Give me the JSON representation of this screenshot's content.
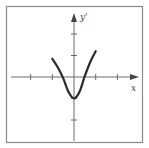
{
  "chart_data": {
    "type": "line",
    "title": "",
    "xlabel": "x",
    "ylabel": "y'",
    "xlim": [
      -3,
      3
    ],
    "ylim": [
      -3,
      3
    ],
    "grid": false,
    "legend": null,
    "x_ticks": [
      -2,
      -1,
      1,
      2
    ],
    "y_ticks": [
      -2,
      -1,
      1,
      2
    ],
    "tick_labels_shown": false,
    "series": [
      {
        "name": "y'",
        "x": [
          -1.0,
          -0.75,
          -0.5,
          -0.25,
          0.0,
          0.25,
          0.5,
          0.75,
          1.0
        ],
        "y": [
          0.85,
          0.45,
          -0.05,
          -0.7,
          -1.0,
          -0.7,
          0.05,
          0.7,
          1.2
        ]
      }
    ],
    "annotations": []
  },
  "labels": {
    "x_axis": "x",
    "y_axis": "y'"
  }
}
